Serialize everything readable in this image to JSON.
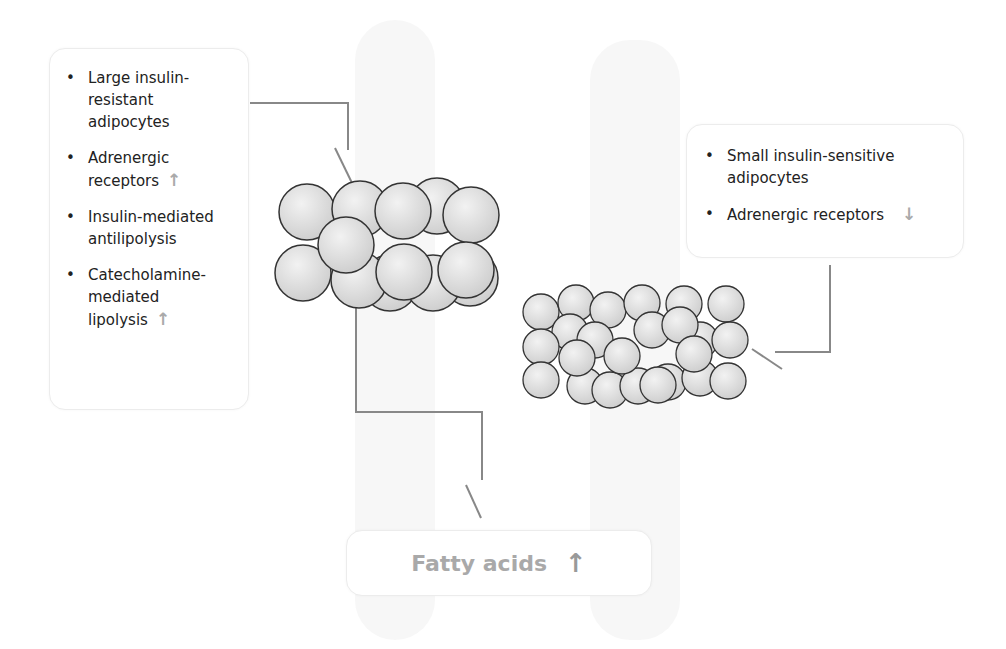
{
  "left_box": {
    "items": [
      {
        "text": "Large insulin-resistant adipocytes",
        "arrow": ""
      },
      {
        "text": "Adrenergic receptors",
        "arrow": "↑"
      },
      {
        "text": "Insulin-mediated antilipolysis",
        "arrow": ""
      },
      {
        "text": "Catecholamine-mediated lipolysis",
        "arrow": "↑"
      }
    ]
  },
  "right_box": {
    "items": [
      {
        "text": "Small insulin-sensitive adipocytes",
        "arrow": ""
      },
      {
        "text": "Adrenergic receptors",
        "arrow": "↓"
      }
    ]
  },
  "bottom_box": {
    "label": "Fatty acids",
    "arrow": "↑"
  },
  "colors": {
    "connector": "#888888",
    "arrow": "#aaaaaa",
    "cell_fill": "#dcdcdc",
    "cell_stroke": "#333333"
  }
}
